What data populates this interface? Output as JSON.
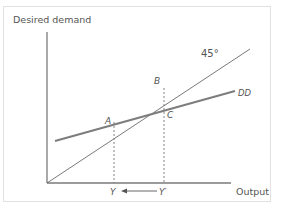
{
  "diagram": {
    "y_axis_label": "Desired demand",
    "x_axis_label": "Output",
    "line_45_label": "45°",
    "dd_label": "DD",
    "points": {
      "A": "A",
      "B": "B",
      "C": "C"
    },
    "x_markers": {
      "Y": "Y",
      "Y_prime": "Y′"
    },
    "colors": {
      "axis": "#777777",
      "line_45": "#6a6a6a",
      "dd_line": "#7d7d7d",
      "dashed": "#777777",
      "text": "#555555",
      "frame_border": "#e2e2e2"
    }
  }
}
